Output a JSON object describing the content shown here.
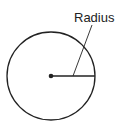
{
  "diagram": {
    "label": "Radius",
    "stroke_color": "#222222",
    "background": "#ffffff",
    "circle": {
      "cx": 51,
      "cy": 76,
      "r": 44
    },
    "center_point": {
      "x": 51,
      "y": 76
    },
    "radius_line": {
      "x1": 51,
      "y1": 76,
      "x2": 95,
      "y2": 76
    },
    "leader_line": {
      "x1": 92,
      "y1": 25,
      "x2": 73,
      "y2": 76
    }
  }
}
